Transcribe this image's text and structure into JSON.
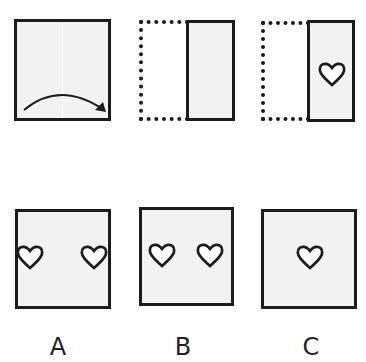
{
  "puzzle": {
    "top_row": {
      "step1": {
        "description": "square paper folded along vertical center line",
        "arrow": "curved-arrow-left-to-right"
      },
      "step2": {
        "description": "left half folded over onto right half"
      },
      "step3": {
        "description": "heart cut out of folded paper"
      }
    },
    "options": [
      {
        "label": "A",
        "hearts": 2,
        "position": "hearts at left and right edges"
      },
      {
        "label": "B",
        "hearts": 2,
        "position": "two hearts near center"
      },
      {
        "label": "C",
        "hearts": 1,
        "position": "single heart in center"
      }
    ]
  },
  "colors": {
    "paper": "#f2f2f2",
    "outline": "#1c1c1c",
    "background": "#ffffff"
  }
}
